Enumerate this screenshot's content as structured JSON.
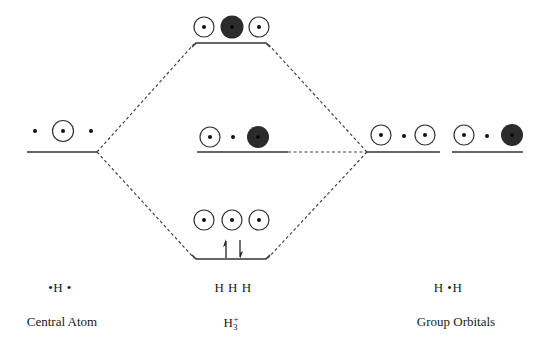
{
  "colors": {
    "line": "#333333",
    "dashed": "#444444",
    "filled_lobe": "#2b2b2b",
    "open_lobe": "#ffffff",
    "background": "#ffffff"
  },
  "columns": {
    "left": {
      "label": "Central Atom",
      "atom_text": "•H •",
      "levels": [
        {
          "name": "central-1s",
          "orbitals": [
            "dot",
            "open",
            "dot"
          ]
        }
      ]
    },
    "middle": {
      "label_main": "H",
      "label_sub": "3",
      "label_sup": "+",
      "atom_text": "H H H",
      "levels": [
        {
          "name": "antibonding-mo",
          "position": "top",
          "orbitals": [
            "open",
            "filled",
            "open"
          ]
        },
        {
          "name": "nonbonding-mo",
          "position": "middle",
          "orbitals": [
            "open",
            "dot",
            "filled"
          ]
        },
        {
          "name": "bonding-mo",
          "position": "bottom",
          "orbitals": [
            "open",
            "open",
            "open"
          ],
          "electrons": [
            "up",
            "down"
          ]
        }
      ]
    },
    "right": {
      "label": "Group Orbitals",
      "atom_text": "H •H",
      "levels": [
        {
          "name": "group-orbital-symmetric",
          "orbitals": [
            "open",
            "dot",
            "open"
          ]
        },
        {
          "name": "group-orbital-antisymmetric",
          "orbitals": [
            "open",
            "dot",
            "filled"
          ]
        }
      ]
    }
  }
}
